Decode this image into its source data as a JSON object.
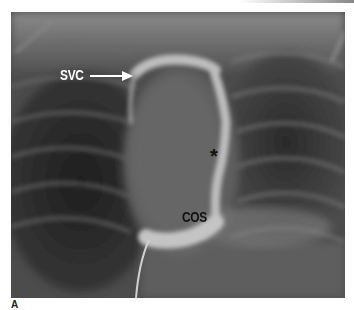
{
  "figure": {
    "panel_label": "A",
    "annotations": {
      "svc": "SVC",
      "cos": "COS",
      "asterisk": "*"
    },
    "colors": {
      "background_dark": "#2a2a2a",
      "soft_tissue": "#6e6e6e",
      "contrast_bright": "#c8c8c8",
      "svc_label": "#ffffff",
      "cos_label": "#111111"
    }
  }
}
